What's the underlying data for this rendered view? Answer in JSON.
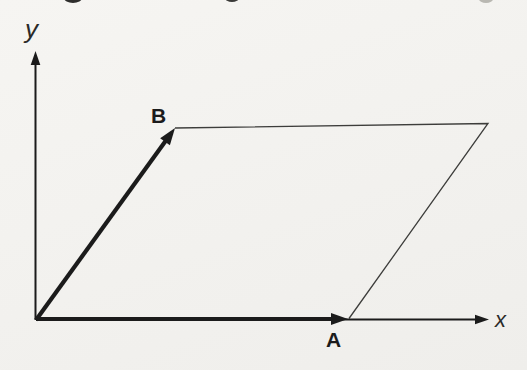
{
  "labels": {
    "y_axis": "y",
    "x_axis": "x",
    "vector_a": "A",
    "vector_b": "B"
  },
  "colors": {
    "paper": "#f6f5f2",
    "paper_shade": "#efeeeb",
    "ink": "#1b1b1b",
    "thin_line": "#3d3d3b",
    "label": "#2a2a28"
  },
  "geometry": {
    "origin": [
      36,
      320
    ],
    "y_axis_tip": [
      35.5,
      51
    ],
    "x_axis_tip": [
      489,
      319.5
    ],
    "vector_a_tip": [
      348,
      319
    ],
    "vector_b_tip": [
      175,
      128
    ],
    "parallelogram_corner": [
      488,
      123.5
    ],
    "axis_arrow": {
      "length": 14,
      "half_width": 4.8
    },
    "vector_arrow": {
      "length": 17,
      "half_width": 6
    }
  },
  "label_positions": {
    "y_axis": [
      25,
      38
    ],
    "x_axis": [
      495,
      327
    ],
    "vector_a": [
      326,
      347
    ],
    "vector_b": [
      151,
      123
    ]
  },
  "scan_artifacts": [
    {
      "cx": 73,
      "cy": -2,
      "rx": 9,
      "ry": 5,
      "fill": "#2e2e2c"
    },
    {
      "cx": 232,
      "cy": -2,
      "rx": 7,
      "ry": 4,
      "fill": "#3a3a38"
    },
    {
      "cx": 486,
      "cy": -1,
      "rx": 7,
      "ry": 4,
      "fill": "#b9b8b2"
    }
  ]
}
